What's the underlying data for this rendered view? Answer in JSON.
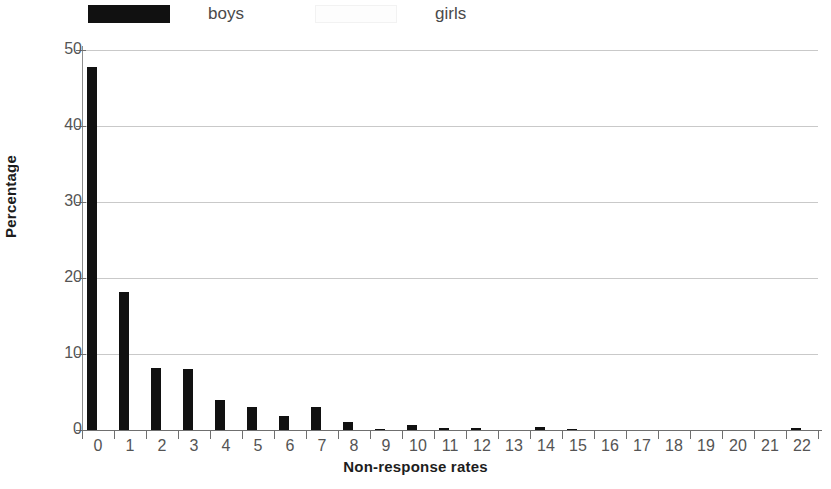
{
  "chart_data": {
    "type": "bar",
    "title": "",
    "xlabel": "Non-response rates",
    "ylabel": "Percentage",
    "categories": [
      "0",
      "1",
      "2",
      "3",
      "4",
      "5",
      "6",
      "7",
      "8",
      "9",
      "10",
      "11",
      "12",
      "13",
      "14",
      "15",
      "16",
      "17",
      "18",
      "19",
      "20",
      "21",
      "22"
    ],
    "ylim": [
      0,
      50
    ],
    "yticks": [
      0,
      10,
      20,
      30,
      40,
      50
    ],
    "ytick_labels": [
      "0",
      "10",
      "20",
      "30",
      "40",
      "50"
    ],
    "grid": true,
    "legend_position": "top-left",
    "series": [
      {
        "name": "boys",
        "color": "#111111",
        "values": [
          47.8,
          18.1,
          8.2,
          8.0,
          4.0,
          3.0,
          1.8,
          3.0,
          1.1,
          0.1,
          0.6,
          0.3,
          0.2,
          0.0,
          0.4,
          0.15,
          0.0,
          0.0,
          0.0,
          0.0,
          0.0,
          0.0,
          0.25
        ]
      },
      {
        "name": "girls",
        "color": "#ffffff",
        "values": [
          0,
          0,
          0,
          0,
          0,
          0,
          0,
          0,
          0,
          0,
          0,
          0,
          0,
          0,
          0,
          0,
          0,
          0,
          0,
          0,
          0,
          0,
          0
        ]
      }
    ]
  },
  "legend": {
    "boys_label": "boys",
    "girls_label": "girls",
    "boys_swatch_color": "#111111",
    "girls_swatch_color": "#ffffff"
  },
  "axes": {
    "y_title": "Percentage",
    "x_title": "Non-response rates"
  }
}
